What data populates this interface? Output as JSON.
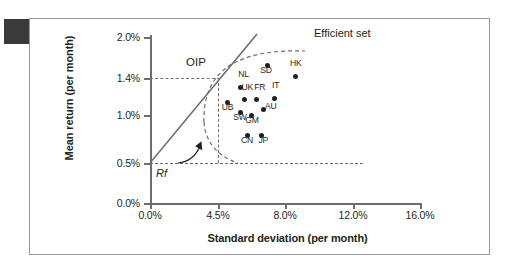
{
  "figure": {
    "corner_marker": "black-square"
  },
  "chart_data": {
    "type": "scatter",
    "title": "",
    "xlabel": "Standard deviation (per month)",
    "ylabel": "Mean return (per month)",
    "xlim": [
      0.0,
      16.0
    ],
    "ylim": [
      0.0,
      2.0
    ],
    "xticks": [
      "0.0%",
      "4.5%",
      "8.0%",
      "12.0%",
      "16.0%"
    ],
    "xtick_values": [
      0.0,
      4.5,
      8.0,
      12.0,
      16.0
    ],
    "yticks": [
      "0.0%",
      "0.5%",
      "1.0%",
      "1.4%",
      "2.0%"
    ],
    "ytick_values": [
      0.0,
      0.5,
      1.0,
      1.4,
      2.0
    ],
    "grid": false,
    "legend": "none",
    "points": [
      {
        "label": "SD",
        "x": 6.95,
        "y": 1.58,
        "label_dx": -7,
        "label_dy": 5
      },
      {
        "label": "HK",
        "x": 8.65,
        "y": 1.42,
        "label_dx": -6,
        "label_dy": -13
      },
      {
        "label": "NL",
        "x": 5.35,
        "y": 1.3,
        "label_dx": -2,
        "label_dy": -12
      },
      {
        "label": "UK",
        "x": 5.6,
        "y": 1.17,
        "label_dx": -3,
        "label_dy": -11
      },
      {
        "label": "FR",
        "x": 6.3,
        "y": 1.17,
        "label_dx": -2,
        "label_dy": -11
      },
      {
        "label": "IT",
        "x": 7.35,
        "y": 1.18,
        "label_dx": -2,
        "label_dy": -12
      },
      {
        "label": "UB",
        "x": 4.6,
        "y": 1.13,
        "label_dx": -6,
        "label_dy": 5
      },
      {
        "label": "SW",
        "x": 5.35,
        "y": 1.03,
        "label_dx": -7,
        "label_dy": 6
      },
      {
        "label": "GM",
        "x": 6.0,
        "y": 1.0,
        "label_dx": -6,
        "label_dy": 6
      },
      {
        "label": "AU",
        "x": 6.75,
        "y": 1.06,
        "label_dx": 1,
        "label_dy": -2
      },
      {
        "label": "CN",
        "x": 5.75,
        "y": 0.79,
        "label_dx": -6,
        "label_dy": 6
      },
      {
        "label": "JP",
        "x": 6.6,
        "y": 0.79,
        "label_dx": -3,
        "label_dy": 6
      }
    ],
    "annotations": [
      {
        "name": "OIP",
        "text": "OIP",
        "x": 4.9,
        "y": 1.45,
        "note": "optimal-international-portfolio tangency point"
      },
      {
        "name": "Efficient set",
        "text": "Efficient set",
        "x": 10.5,
        "y": 1.85
      },
      {
        "name": "Rf",
        "text": "Rf",
        "x": 0.45,
        "y": 0.36,
        "note": "risk-free rate intercept at 0.5%"
      }
    ],
    "lines": [
      {
        "name": "capital-market-line",
        "style": "solid",
        "from": [
          0.0,
          0.5
        ],
        "to": [
          6.25,
          1.95
        ],
        "note": "tangent line from risk-free rate through OIP"
      },
      {
        "name": "efficient-set-curve",
        "style": "dashed",
        "note": "minimum-variance frontier hull around the country points"
      }
    ],
    "guides": [
      {
        "name": "oip-return-guide",
        "style": "dashed",
        "orientation": "horizontal",
        "value": 1.4,
        "from_x": 0.0,
        "to_x": 5.0
      },
      {
        "name": "rf-guide",
        "style": "dashed",
        "orientation": "horizontal",
        "value": 0.5,
        "from_x": 0.0,
        "to_x": 12.6
      },
      {
        "name": "oip-risk-guide",
        "style": "dashed",
        "orientation": "vertical",
        "value": 4.9,
        "from_y": 0.5,
        "to_y": 1.28
      }
    ],
    "colors": {
      "point": "#231f20",
      "axis": "#6d6d6d",
      "line": "#6d6d6d",
      "frame": "#9a9a9a",
      "text": "#231f20"
    }
  }
}
